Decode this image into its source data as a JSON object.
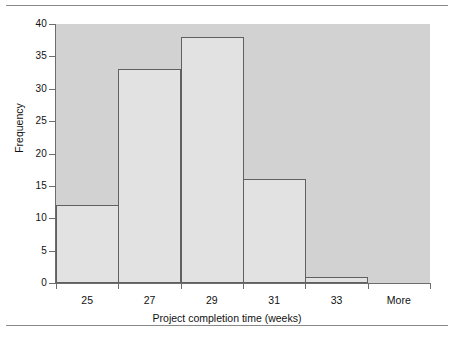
{
  "chart_data": {
    "type": "bar",
    "title": "",
    "subtitle": "",
    "xlabel": "Project completion time (weeks)",
    "ylabel": "Frequency",
    "categories": [
      "25",
      "27",
      "29",
      "31",
      "33",
      "More"
    ],
    "values": [
      12,
      33,
      38,
      16,
      1,
      0
    ],
    "series": [
      {
        "name": "Frequency",
        "values": [
          12,
          33,
          38,
          16,
          1,
          0
        ]
      }
    ],
    "ylim": [
      0,
      40
    ],
    "yticks": [
      0,
      5,
      10,
      15,
      20,
      25,
      30,
      35,
      40
    ],
    "ytick_labels": [
      "0",
      "5",
      "10",
      "15",
      "20",
      "25",
      "30",
      "35",
      "40"
    ],
    "grid": false,
    "legend": false,
    "legend_position": "none",
    "bar_style": "histogram-contiguous",
    "colors": {
      "plot_background": "#d2d2d2",
      "bar_fill": "#e2e2e2",
      "bar_border": "#606060",
      "axis": "#6d6d6d",
      "text": "#111111",
      "page_background": "#ffffff",
      "rule": "#8a8a8a"
    }
  }
}
